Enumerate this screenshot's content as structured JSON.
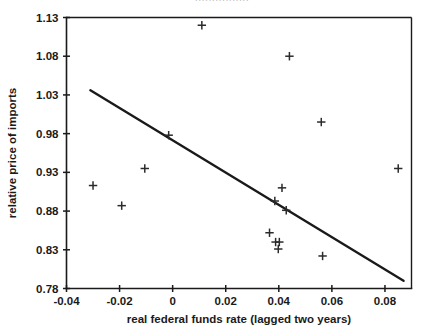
{
  "figure": {
    "top_clipped_text": "················",
    "background_color": "#ffffff",
    "ink_color": "#1a1a1a"
  },
  "chart_data": {
    "type": "scatter",
    "title": "",
    "xlabel": "real federal funds rate (lagged two years)",
    "ylabel": "relative price of imports",
    "xlim": [
      -0.04,
      0.09
    ],
    "ylim": [
      0.78,
      1.13
    ],
    "xticks": [
      -0.04,
      -0.02,
      0,
      0.02,
      0.04,
      0.06,
      0.08
    ],
    "xticklabels": [
      "-0.04",
      "-0.02",
      "0",
      "0.02",
      "0.04",
      "0.06",
      "0.08"
    ],
    "yticks": [
      0.78,
      0.83,
      0.88,
      0.93,
      0.98,
      1.03,
      1.08,
      1.13
    ],
    "yticklabels": [
      "0.78",
      "0.83",
      "0.88",
      "0.93",
      "0.98",
      "1.03",
      "1.08",
      "1.13"
    ],
    "grid": false,
    "legend": null,
    "marker": "plus",
    "marker_color": "#2b2b2b",
    "points": [
      {
        "x": -0.03,
        "y": 0.913
      },
      {
        "x": -0.0192,
        "y": 0.887
      },
      {
        "x": -0.0105,
        "y": 0.935
      },
      {
        "x": -0.0015,
        "y": 0.978
      },
      {
        "x": 0.011,
        "y": 1.12
      },
      {
        "x": 0.0365,
        "y": 0.852
      },
      {
        "x": 0.0385,
        "y": 0.893
      },
      {
        "x": 0.0388,
        "y": 0.84
      },
      {
        "x": 0.0402,
        "y": 0.84
      },
      {
        "x": 0.0398,
        "y": 0.831
      },
      {
        "x": 0.0412,
        "y": 0.91
      },
      {
        "x": 0.0428,
        "y": 0.881
      },
      {
        "x": 0.044,
        "y": 1.08
      },
      {
        "x": 0.056,
        "y": 0.995
      },
      {
        "x": 0.0565,
        "y": 0.822
      },
      {
        "x": 0.085,
        "y": 0.935
      }
    ],
    "fit_line": {
      "name": "regression line",
      "x0": -0.031,
      "y0": 1.036,
      "x1": 0.087,
      "y1": 0.79,
      "color": "#1a1a1a"
    }
  }
}
